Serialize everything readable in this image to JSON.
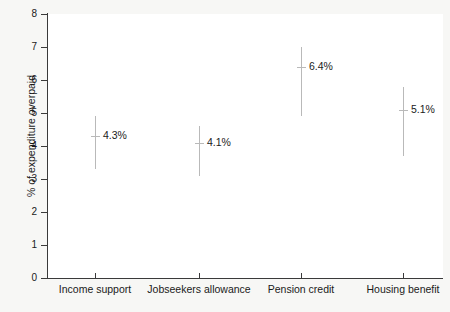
{
  "chart_data": {
    "type": "scatter",
    "title": "",
    "subtitle": "",
    "xlabel": "",
    "ylabel": "% of expenditure overpaid",
    "categories": [
      "Income support",
      "Jobseekers allowance",
      "Pension credit",
      "Housing benefit"
    ],
    "values": [
      4.3,
      4.1,
      6.4,
      5.1
    ],
    "data_labels": [
      "4.3%",
      "4.1%",
      "6.4%",
      "5.1%"
    ],
    "error_bars": [
      {
        "category": "Income support",
        "estimate": 4.3,
        "lower": 3.3,
        "upper": 4.9
      },
      {
        "category": "Jobseekers allowance",
        "estimate": 4.1,
        "lower": 3.1,
        "upper": 4.6
      },
      {
        "category": "Pension credit",
        "estimate": 6.4,
        "lower": 4.9,
        "upper": 7.0
      },
      {
        "category": "Housing benefit",
        "estimate": 5.1,
        "lower": 3.7,
        "upper": 5.8
      }
    ],
    "ylim": [
      0,
      8
    ],
    "ytick_labels": [
      "0",
      "1",
      "2",
      "3",
      "4",
      "5",
      "6",
      "7",
      "8"
    ],
    "ytick_values": [
      0,
      1,
      2,
      3,
      4,
      5,
      6,
      7,
      8
    ],
    "grid": false,
    "legend": null,
    "legend_position": "none",
    "series": [
      {
        "name": "% of expenditure overpaid",
        "values": [
          4.3,
          4.1,
          6.4,
          5.1
        ]
      }
    ],
    "colors": {
      "background": "#f7f7f5",
      "plot_background": "#ffffff",
      "axis": "#3a3a3a",
      "errorbar": "#b9b9b9",
      "text": "#1a1a1a"
    }
  }
}
